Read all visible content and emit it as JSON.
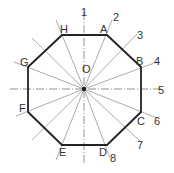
{
  "diagram": {
    "center_label": "O",
    "vertices": [
      {
        "label": "A",
        "x": 107,
        "y": 35
      },
      {
        "label": "B",
        "x": 141,
        "y": 67
      },
      {
        "label": "C",
        "x": 141,
        "y": 112
      },
      {
        "label": "D",
        "x": 107,
        "y": 145
      },
      {
        "label": "E",
        "x": 62,
        "y": 145
      },
      {
        "label": "F",
        "x": 28,
        "y": 112
      },
      {
        "label": "G",
        "x": 28,
        "y": 67
      },
      {
        "label": "H",
        "x": 62,
        "y": 35
      }
    ],
    "numbered_lines": [
      "1",
      "2",
      "3",
      "4",
      "5",
      "6",
      "7",
      "8"
    ],
    "colors": {
      "outline": "#222222",
      "rays": "#888888"
    }
  }
}
